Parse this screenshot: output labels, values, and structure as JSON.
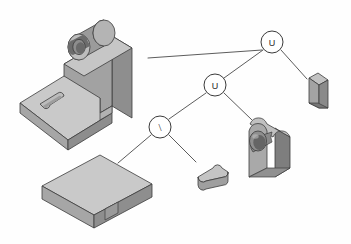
{
  "diagram": {
    "background_color": "#fefefe",
    "line_color": "#4a4a4a",
    "node_fill": "#ffffff",
    "node_stroke": "#3a3a3a",
    "nodes": [
      {
        "id": "root",
        "label": "U",
        "name": "union-operator",
        "cx": 272,
        "cy": 42,
        "r": 11
      },
      {
        "id": "mid",
        "label": "U",
        "name": "union-operator",
        "cx": 215,
        "cy": 85,
        "r": 11
      },
      {
        "id": "diff",
        "label": "\\",
        "name": "difference-operator",
        "cx": 160,
        "cy": 127,
        "r": 11
      }
    ],
    "edges": [
      {
        "name": "edge-root-to-result",
        "x1": 262,
        "y1": 50,
        "x2": 147,
        "y2": 58
      },
      {
        "name": "edge-root-to-wedge",
        "x1": 282,
        "y1": 50,
        "x2": 308,
        "y2": 78
      },
      {
        "name": "edge-root-to-mid",
        "x1": 263,
        "y1": 50,
        "x2": 224,
        "y2": 78
      },
      {
        "name": "edge-mid-to-diff",
        "x1": 206,
        "y1": 93,
        "x2": 169,
        "y2": 119
      },
      {
        "name": "edge-mid-to-block",
        "x1": 224,
        "y1": 93,
        "x2": 252,
        "y2": 119
      },
      {
        "name": "edge-diff-to-plate",
        "x1": 151,
        "y1": 135,
        "x2": 118,
        "y2": 163
      },
      {
        "name": "edge-diff-to-slot",
        "x1": 169,
        "y1": 135,
        "x2": 196,
        "y2": 162
      }
    ],
    "shading": {
      "top_face": "#c9c9c9",
      "front_face": "#a8a8a8",
      "side_face": "#8e8e8e",
      "dark_face": "#6f6f6f",
      "bore_dark": "#5a5a5a",
      "bore_mid": "#848484",
      "highlight": "#d8d8d8",
      "outline": "#3c3c3c"
    },
    "parts": [
      {
        "id": "result",
        "name": "result-solid-bracket",
        "caption": "L-bracket with boss, bore and slot"
      },
      {
        "id": "plate",
        "name": "primitive-base-plate",
        "caption": "rectangular base plate"
      },
      {
        "id": "slot",
        "name": "primitive-slot-bar",
        "caption": "obround slot tool"
      },
      {
        "id": "block",
        "name": "primitive-round-block",
        "caption": "round-top block with bore"
      },
      {
        "id": "wedge",
        "name": "primitive-wedge-rib",
        "caption": "triangular wedge rib"
      }
    ]
  }
}
